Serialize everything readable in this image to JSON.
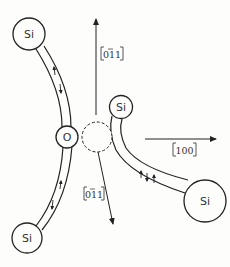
{
  "diagram": {
    "atoms": {
      "si_top": {
        "label": "Si"
      },
      "si_bottom": {
        "label": "Si"
      },
      "oxygen": {
        "label": "O"
      },
      "si_small": {
        "label": "Si"
      },
      "si_right": {
        "label": "Si"
      }
    },
    "vacancy": {
      "style": "dashed-circle"
    },
    "directions": {
      "up": {
        "label": "011",
        "overbar_index": 1,
        "meaning": "[0 -1 1]"
      },
      "right": {
        "label": "100",
        "meaning": "[100]"
      },
      "down": {
        "label": "011",
        "overbar_index": 1,
        "meaning": "[0 -1 1]"
      }
    },
    "bonds": [
      {
        "from": "si_top",
        "to": "oxygen",
        "spin_arrows": [
          "up",
          "down"
        ]
      },
      {
        "from": "oxygen",
        "to": "si_bottom",
        "spin_arrows": [
          "up",
          "down"
        ]
      },
      {
        "from": "si_small",
        "to": "si_right",
        "spin_arrows": [
          "up",
          "down",
          "up"
        ]
      }
    ],
    "colors": {
      "line": "#222222",
      "background": "#fdfdfc"
    }
  }
}
